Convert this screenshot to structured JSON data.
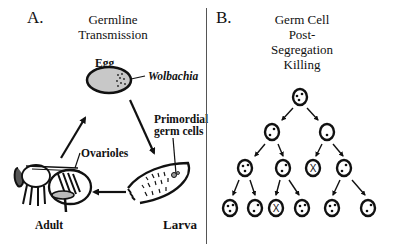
{
  "panel_a": {
    "letter": "A.",
    "title_line1": "Germline",
    "title_line2": "Transmission",
    "labels": {
      "egg": "Egg",
      "wolbachia": "Wolbachia",
      "primordial_line1": "Primordial",
      "primordial_line2": "germ cells",
      "ovarioles": "Ovarioles",
      "adult": "Adult",
      "larva": "Larva"
    },
    "cycle": [
      "Egg",
      "Larva",
      "Adult"
    ]
  },
  "panel_b": {
    "letter": "B.",
    "title_lines": [
      "Germ Cell",
      "Post-",
      "Segregation",
      "Killing"
    ],
    "tree": {
      "rows": [
        [
          {
            "x": 300,
            "y": 97,
            "state": "bacteria-3"
          }
        ],
        [
          {
            "x": 272,
            "y": 132,
            "state": "bacteria-2"
          },
          {
            "x": 327,
            "y": 132,
            "state": "bacteria-1"
          }
        ],
        [
          {
            "x": 245,
            "y": 168,
            "state": "bacteria-3"
          },
          {
            "x": 283,
            "y": 168,
            "state": "bacteria-2"
          },
          {
            "x": 313,
            "y": 168,
            "state": "killed"
          },
          {
            "x": 344,
            "y": 168,
            "state": "bacteria-2"
          }
        ],
        [
          {
            "x": 230,
            "y": 208,
            "state": "bacteria-3"
          },
          {
            "x": 255,
            "y": 208,
            "state": "bacteria-2"
          },
          {
            "x": 276,
            "y": 208,
            "state": "killed"
          },
          {
            "x": 302,
            "y": 208,
            "state": "bacteria-3"
          },
          {
            "x": 332,
            "y": 208,
            "state": "bacteria-3"
          },
          {
            "x": 368,
            "y": 208,
            "state": "bacteria-2"
          }
        ]
      ],
      "killed_marker": "X"
    }
  },
  "colors": {
    "ink": "#111111",
    "egg_fill": "#c8c8c8",
    "divider": "#555555"
  }
}
